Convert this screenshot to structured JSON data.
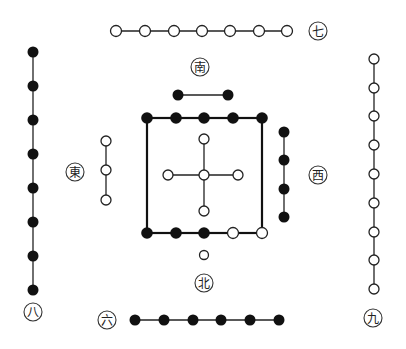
{
  "diagram": {
    "title": "",
    "colors": {
      "black_dot": "#111111",
      "white_dot": "#ffffff",
      "stroke": "#222222",
      "background": "#ffffff"
    },
    "labels": {
      "south": "南",
      "north": "北",
      "east": "東",
      "west": "西",
      "six": "六",
      "seven": "七",
      "eight": "八",
      "nine": "九"
    },
    "groups": [
      {
        "name": "seven-row",
        "color": "white",
        "count": 7,
        "orientation": "horizontal"
      },
      {
        "name": "south-pair",
        "color": "black",
        "count": 2,
        "orientation": "horizontal"
      },
      {
        "name": "eight-column",
        "color": "black",
        "count": 8,
        "orientation": "vertical"
      },
      {
        "name": "nine-column",
        "color": "white",
        "count": 9,
        "orientation": "vertical"
      },
      {
        "name": "east-column",
        "color": "white",
        "count": 3,
        "orientation": "vertical"
      },
      {
        "name": "west-column",
        "color": "black",
        "count": 4,
        "orientation": "vertical"
      },
      {
        "name": "north-dot",
        "color": "white",
        "count": 1
      },
      {
        "name": "six-row",
        "color": "black",
        "count": 6,
        "orientation": "horizontal"
      },
      {
        "name": "center-cross",
        "color": "white",
        "count": 5
      },
      {
        "name": "center-square",
        "color": "mixed",
        "black_count": 8,
        "white_count": 2
      }
    ]
  }
}
